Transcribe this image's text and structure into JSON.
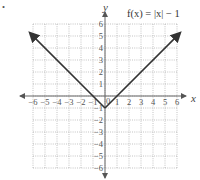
{
  "chart_data": {
    "type": "line",
    "title": "f(x) = |x| − 1",
    "function": "f(x) = |x| - 1",
    "xlabel": "x",
    "ylabel": "y",
    "xlim": [
      -6,
      6
    ],
    "ylim": [
      -6,
      6
    ],
    "grid": true,
    "x_ticks": [
      "-6",
      "-5",
      "-4",
      "-3",
      "-2",
      "-1",
      "1",
      "2",
      "3",
      "4",
      "5",
      "6"
    ],
    "y_ticks": [
      "6",
      "5",
      "4",
      "3",
      "2",
      "1",
      "-1",
      "-2",
      "-3",
      "-4",
      "-5",
      "-6"
    ],
    "origin_label": "0",
    "series": [
      {
        "name": "f(x) = |x| - 1",
        "x": [
          -6.2,
          0,
          6.2
        ],
        "y": [
          5.2,
          -1,
          5.2
        ],
        "arrows": "both"
      }
    ],
    "stray_mark": "•"
  }
}
